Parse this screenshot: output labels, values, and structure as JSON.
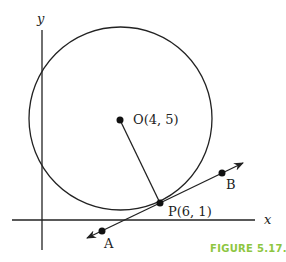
{
  "figure": {
    "caption": "FIGURE 5.17.",
    "caption_color": "#8dc63f",
    "stroke_color": "#222222",
    "axes": {
      "x_label": "x",
      "y_label": "y"
    },
    "center": {
      "label": "O(4, 5)",
      "x": 4,
      "y": 5
    },
    "tangent_point": {
      "label": "P(6, 1)",
      "x": 6,
      "y": 1
    },
    "points": [
      {
        "label": "A"
      },
      {
        "label": "B"
      }
    ]
  }
}
